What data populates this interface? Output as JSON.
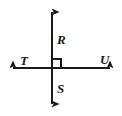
{
  "figure": {
    "kind": "perpendicular-lines-diagram",
    "canvas": {
      "width": 122,
      "height": 116,
      "background": "#ffffff"
    },
    "stroke_color": "#1a1a1a",
    "stroke_width": 2,
    "intersection": {
      "x": 52,
      "y": 68
    },
    "lines": [
      {
        "name": "vertical-line",
        "orientation": "vertical",
        "x1": 52,
        "y1": 4,
        "x2": 52,
        "y2": 112,
        "arrow_start": true,
        "arrow_end": true
      },
      {
        "name": "horizontal-line",
        "orientation": "horizontal",
        "x1": 5,
        "y1": 68,
        "x2": 118,
        "y2": 68,
        "arrow_start": true,
        "arrow_end": true
      }
    ],
    "right_angle_marker": {
      "name": "right-angle-marker",
      "quadrant": "upper-right",
      "x": 52,
      "y": 59,
      "size": 9
    },
    "labels": [
      {
        "id": "R",
        "text": "R",
        "x": 57,
        "y": 44,
        "ray": "up",
        "anchor": "start"
      },
      {
        "id": "T",
        "text": "T",
        "x": 20,
        "y": 65,
        "ray": "left",
        "anchor": "start"
      },
      {
        "id": "U",
        "text": "U",
        "x": 100,
        "y": 64,
        "ray": "right",
        "anchor": "start"
      },
      {
        "id": "S",
        "text": "S",
        "x": 57,
        "y": 93,
        "ray": "down",
        "anchor": "start"
      }
    ]
  }
}
